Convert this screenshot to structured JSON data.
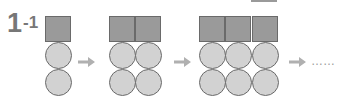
{
  "problem_label": {
    "main": "1",
    "sub": "-1"
  },
  "figures": [
    {
      "columns": 1,
      "squares_per_column": 1,
      "circles_per_column": 2
    },
    {
      "columns": 2,
      "squares_per_column": 1,
      "circles_per_column": 2
    },
    {
      "columns": 3,
      "squares_per_column": 1,
      "circles_per_column": 2
    }
  ],
  "continuation": "……",
  "colors": {
    "square_fill": "#9a9a9a",
    "circle_fill": "#d2d2d2",
    "outline": "#6a6a6a",
    "arrow": "#b0b0b0",
    "label": "#777777"
  }
}
